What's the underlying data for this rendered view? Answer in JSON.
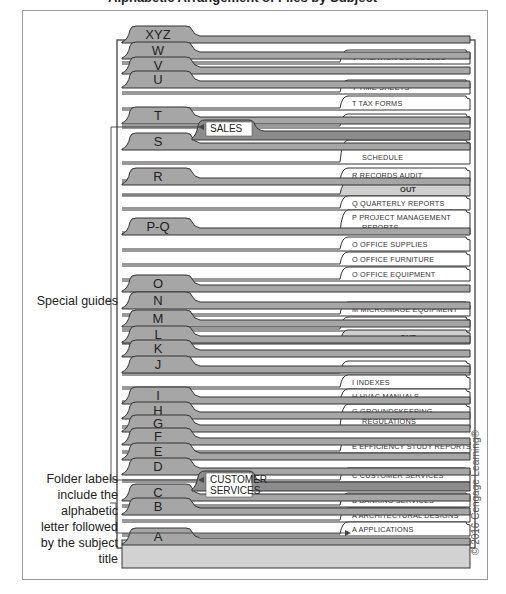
{
  "figure": {
    "title_fragment": "Alphabetic Arrangement of Files by Subject",
    "copyright": "© 2016 Cengage Learning®"
  },
  "callouts": {
    "special_guides": "Special guides",
    "folder_labels": "Folder labels include the alphabetic letter followed by the subject title"
  },
  "colors": {
    "guide_fill": "#a6a6a6",
    "guide_dark": "#8c8c8c",
    "folder_fill": "#ffffff",
    "out_fill": "#cfcfcf",
    "drawer_base": "#d2d2d2",
    "outline": "#333333"
  },
  "guides": [
    {
      "label": "XYZ",
      "y": 26
    },
    {
      "label": "W",
      "y": 42
    },
    {
      "label": "V",
      "y": 57
    },
    {
      "label": "U",
      "y": 71
    },
    {
      "label": "T",
      "y": 107
    },
    {
      "label": "S",
      "y": 133
    },
    {
      "label": "R",
      "y": 168
    },
    {
      "label": "P-Q",
      "y": 218
    },
    {
      "label": "O",
      "y": 275
    },
    {
      "label": "N",
      "y": 292
    },
    {
      "label": "M",
      "y": 310
    },
    {
      "label": "L",
      "y": 326
    },
    {
      "label": "K",
      "y": 340
    },
    {
      "label": "J",
      "y": 356
    },
    {
      "label": "I",
      "y": 387
    },
    {
      "label": "H",
      "y": 402
    },
    {
      "label": "G",
      "y": 415
    },
    {
      "label": "F",
      "y": 428
    },
    {
      "label": "E",
      "y": 443
    },
    {
      "label": "D",
      "y": 458
    },
    {
      "label": "C",
      "y": 484
    },
    {
      "label": "B",
      "y": 498
    },
    {
      "label": "A",
      "y": 528
    }
  ],
  "folders": [
    {
      "letter": "V",
      "title": "VACATION SCHEDULES",
      "y": 50,
      "type": "folder"
    },
    {
      "letter": "T",
      "title": "TIME SHEETS",
      "y": 80,
      "type": "folder"
    },
    {
      "letter": "T",
      "title": "TAX FORMS",
      "y": 96,
      "type": "folder"
    },
    {
      "letter": "S",
      "title": "SALES",
      "y": 114,
      "type": "folder"
    },
    {
      "letter": "R",
      "title": "RECORDS RETENTION",
      "title2": "SCHEDULE",
      "y": 140,
      "type": "folder"
    },
    {
      "letter": "R",
      "title": "RECORDS AUDIT",
      "y": 168,
      "type": "folder"
    },
    {
      "letter": "",
      "title": "OUT",
      "y": 182,
      "type": "out"
    },
    {
      "letter": "Q",
      "title": "QUARTERLY REPORTS",
      "y": 196,
      "type": "folder"
    },
    {
      "letter": "P",
      "title": "PROJECT MANAGEMENT",
      "title2": "REPORTS",
      "y": 210,
      "type": "folder"
    },
    {
      "letter": "O",
      "title": "OFFICE SUPPLIES",
      "y": 237,
      "type": "folder"
    },
    {
      "letter": "O",
      "title": "OFFICE FURNITURE",
      "y": 252,
      "type": "folder"
    },
    {
      "letter": "O",
      "title": "OFFICE EQUIPMENT",
      "y": 267,
      "type": "folder"
    },
    {
      "letter": "M",
      "title": "MICROIMAGE EQUIPMENT",
      "y": 302,
      "type": "folder"
    },
    {
      "letter": "L",
      "title": "LANDSCAPE DESIGNS",
      "y": 317,
      "type": "folder"
    },
    {
      "letter": "",
      "title": "OUT",
      "y": 330,
      "type": "out"
    },
    {
      "letter": "I",
      "title": "INVENTORIES",
      "y": 361,
      "type": "folder"
    },
    {
      "letter": "I",
      "title": "INDEXES",
      "y": 375,
      "type": "folder"
    },
    {
      "letter": "H",
      "title": "HVAC MANUALS",
      "y": 389,
      "type": "folder"
    },
    {
      "letter": "G",
      "title": "GROUNDSKEEPING",
      "title2": "REGULATIONS",
      "y": 404,
      "type": "folder"
    },
    {
      "letter": "E",
      "title": "EFFICIENCY STUDY REPORTS",
      "y": 439,
      "type": "folder"
    },
    {
      "letter": "C",
      "title": "CUSTOMER SERVICES",
      "y": 468,
      "type": "folder"
    },
    {
      "letter": "B",
      "title": "BANKING SERVICES",
      "y": 493,
      "type": "folder"
    },
    {
      "letter": "A",
      "title": "ARCHITECTURAL DESIGNS",
      "y": 508,
      "type": "folder"
    },
    {
      "letter": "A",
      "title": "APPLICATIONS",
      "y": 522,
      "type": "folder"
    }
  ],
  "special_guides": [
    {
      "label": "SALES",
      "y": 120
    },
    {
      "label": "CUSTOMER",
      "label2": "SERVICES",
      "y": 471
    }
  ]
}
